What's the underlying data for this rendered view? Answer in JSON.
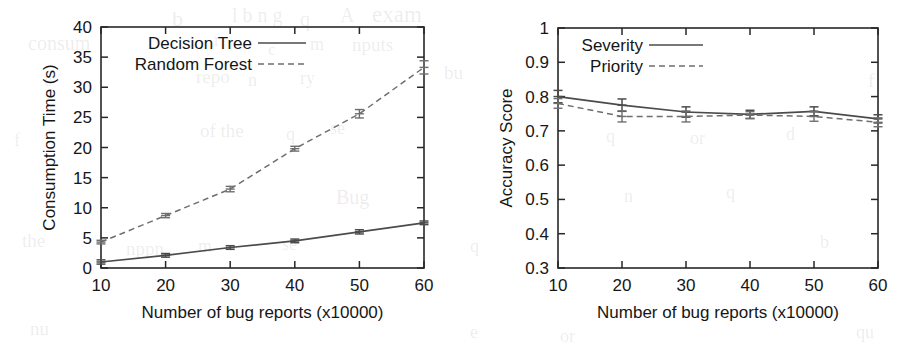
{
  "figure": {
    "background_color": "#ffffff",
    "ink_color": "#272727"
  },
  "chart_data": [
    {
      "id": "consumption-time",
      "type": "line",
      "title": "",
      "xlabel": "Number of bug reports (x10000)",
      "ylabel": "Consumption Time (s)",
      "x": [
        10,
        20,
        30,
        40,
        50,
        60
      ],
      "xtick_labels": [
        "10",
        "20",
        "30",
        "40",
        "50",
        "60"
      ],
      "ytick_labels": [
        "0",
        "5",
        "10",
        "15",
        "20",
        "25",
        "30",
        "35",
        "40"
      ],
      "xlim": [
        10,
        60
      ],
      "ylim": [
        0,
        40
      ],
      "grid": false,
      "legend_position": "top-left",
      "series": [
        {
          "name": "Decision Tree",
          "style": "solid",
          "values": [
            1.0,
            2.1,
            3.4,
            4.5,
            6.0,
            7.5
          ],
          "errors": [
            0.35,
            0.3,
            0.3,
            0.3,
            0.35,
            0.3
          ]
        },
        {
          "name": "Random Forest",
          "style": "dashed",
          "values": [
            4.3,
            8.7,
            13.1,
            19.8,
            25.6,
            33.3
          ],
          "errors": [
            0.3,
            0.35,
            0.45,
            0.4,
            0.7,
            1.1
          ]
        }
      ]
    },
    {
      "id": "accuracy-score",
      "type": "line",
      "title": "",
      "xlabel": "Number of bug reports (x10000)",
      "ylabel": "Accuracy Score",
      "x": [
        10,
        20,
        30,
        40,
        50,
        60
      ],
      "xtick_labels": [
        "10",
        "20",
        "30",
        "40",
        "50",
        "60"
      ],
      "ytick_labels": [
        "0.3",
        "0.4",
        "0.5",
        "0.6",
        "0.7",
        "0.8",
        "0.9",
        "1"
      ],
      "xlim": [
        10,
        60
      ],
      "ylim": [
        0.3,
        1.0
      ],
      "grid": false,
      "legend_position": "top-left",
      "series": [
        {
          "name": "Severity",
          "style": "solid",
          "values": [
            0.8,
            0.775,
            0.755,
            0.748,
            0.757,
            0.735
          ],
          "errors": [
            0.018,
            0.018,
            0.015,
            0.012,
            0.013,
            0.012
          ]
        },
        {
          "name": "Priority",
          "style": "dashed",
          "values": [
            0.78,
            0.742,
            0.742,
            0.746,
            0.742,
            0.725
          ],
          "errors": [
            0.014,
            0.016,
            0.016,
            0.01,
            0.014,
            0.013
          ]
        }
      ]
    }
  ],
  "ghost_text": [
    {
      "text": "b",
      "x": 172,
      "y": 6,
      "size": 22
    },
    {
      "text": "l b n g",
      "x": 232,
      "y": 4,
      "size": 20
    },
    {
      "text": "q",
      "x": 300,
      "y": 8,
      "size": 20
    },
    {
      "text": "A",
      "x": 340,
      "y": 4,
      "size": 20
    },
    {
      "text": "exam",
      "x": 372,
      "y": 2,
      "size": 23
    },
    {
      "text": "consum",
      "x": 28,
      "y": 32,
      "size": 20
    },
    {
      "text": "r",
      "x": 214,
      "y": 30,
      "size": 18
    },
    {
      "text": "c",
      "x": 268,
      "y": 40,
      "size": 17
    },
    {
      "text": "m",
      "x": 310,
      "y": 34,
      "size": 18
    },
    {
      "text": "nputs",
      "x": 352,
      "y": 34,
      "size": 19
    },
    {
      "text": "repo",
      "x": 196,
      "y": 66,
      "size": 19
    },
    {
      "text": "e",
      "x": 44,
      "y": 70,
      "size": 18
    },
    {
      "text": "n",
      "x": 248,
      "y": 70,
      "size": 18
    },
    {
      "text": "ry",
      "x": 300,
      "y": 68,
      "size": 18
    },
    {
      "text": "bu",
      "x": 444,
      "y": 62,
      "size": 19
    },
    {
      "text": "f",
      "x": 868,
      "y": 70,
      "size": 19
    },
    {
      "text": "of the",
      "x": 200,
      "y": 120,
      "size": 19
    },
    {
      "text": "q",
      "x": 286,
      "y": 124,
      "size": 18
    },
    {
      "text": "se",
      "x": 330,
      "y": 118,
      "size": 18
    },
    {
      "text": "f",
      "x": 14,
      "y": 130,
      "size": 18
    },
    {
      "text": "q",
      "x": 606,
      "y": 126,
      "size": 18
    },
    {
      "text": "or",
      "x": 690,
      "y": 128,
      "size": 18
    },
    {
      "text": "d",
      "x": 786,
      "y": 124,
      "size": 18
    },
    {
      "text": "Bug",
      "x": 336,
      "y": 186,
      "size": 20
    },
    {
      "text": "n",
      "x": 624,
      "y": 186,
      "size": 18
    },
    {
      "text": "q",
      "x": 726,
      "y": 182,
      "size": 18
    },
    {
      "text": "the",
      "x": 22,
      "y": 230,
      "size": 19
    },
    {
      "text": "nppn",
      "x": 126,
      "y": 238,
      "size": 19
    },
    {
      "text": "m",
      "x": 198,
      "y": 236,
      "size": 18
    },
    {
      "text": "se",
      "x": 282,
      "y": 234,
      "size": 18
    },
    {
      "text": "q",
      "x": 470,
      "y": 236,
      "size": 18
    },
    {
      "text": "b",
      "x": 820,
      "y": 232,
      "size": 18
    },
    {
      "text": "nu",
      "x": 30,
      "y": 318,
      "size": 19
    },
    {
      "text": "e",
      "x": 470,
      "y": 322,
      "size": 18
    },
    {
      "text": "or",
      "x": 560,
      "y": 326,
      "size": 18
    },
    {
      "text": "qu",
      "x": 856,
      "y": 322,
      "size": 18
    }
  ]
}
